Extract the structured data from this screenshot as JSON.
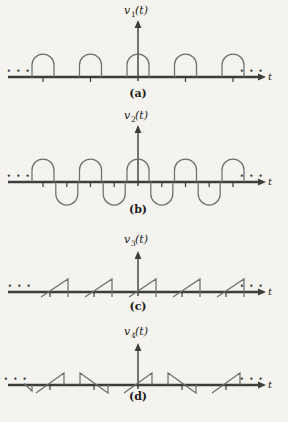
{
  "figure": {
    "colors": {
      "background": "#f5f3ef",
      "axis": "#3d3d3d",
      "waveform": "#6f6f6f",
      "text": "#1c1c1c",
      "dots": "#3f3f3f"
    },
    "panels": [
      {
        "id": "a",
        "var_base": "v",
        "var_sub": "1",
        "var_arg": "(t)",
        "axis_label": "t",
        "caption": "(a)",
        "ellipsis_left": "• • •",
        "ellipsis_right": "• • •",
        "shape": "periodic train of rounded dome pulses above the axis"
      },
      {
        "id": "b",
        "var_base": "v",
        "var_sub": "2",
        "var_arg": "(t)",
        "axis_label": "t",
        "caption": "(b)",
        "ellipsis_left": "• • •",
        "ellipsis_right": "• • •",
        "shape": "alternating rounded dome pulses above and below the axis"
      },
      {
        "id": "c",
        "var_base": "v",
        "var_sub": "3",
        "var_arg": "(t)",
        "axis_label": "t",
        "caption": "(c)",
        "ellipsis_left": "• • •",
        "ellipsis_right": "• • •",
        "shape": "periodic sawtooth ramps rising through the axis with vertical drops"
      },
      {
        "id": "d",
        "var_base": "v",
        "var_sub": "4",
        "var_arg": "(t)",
        "axis_label": "t",
        "caption": "(d)",
        "ellipsis_left": "• • •",
        "ellipsis_right": "• • •",
        "shape": "alternating positive and negative sawtooth teeth"
      }
    ]
  }
}
